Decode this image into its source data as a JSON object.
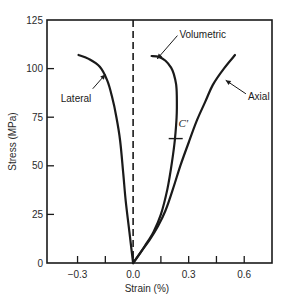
{
  "chart_data": {
    "type": "line",
    "title": "",
    "xlabel": "Strain (%)",
    "ylabel": "Stress (MPa)",
    "xlim": [
      -0.465,
      0.75
    ],
    "ylim": [
      0,
      125
    ],
    "x_ticks": [
      -0.3,
      -0.15,
      0.0,
      0.15,
      0.3,
      0.45,
      0.6
    ],
    "x_tick_labels": [
      "-0.3",
      "",
      "0.0",
      "",
      "0.3",
      "",
      "0.6"
    ],
    "y_ticks": [
      0,
      25,
      50,
      75,
      100,
      125
    ],
    "y_tick_labels": [
      "0",
      "25",
      "50",
      "75",
      "100",
      "125"
    ],
    "grid": false,
    "legend": null,
    "reference_line": {
      "x": 0.0,
      "style": "dashed"
    },
    "series": [
      {
        "name": "Lateral",
        "x": [
          -0.295,
          -0.24,
          -0.18,
          -0.14,
          -0.115,
          -0.09,
          -0.07,
          -0.055,
          -0.04,
          -0.02,
          0.0
        ],
        "y": [
          107,
          105,
          101,
          94,
          86,
          75,
          63,
          48,
          32,
          16,
          0
        ]
      },
      {
        "name": "Volumetric",
        "x": [
          0.1,
          0.14,
          0.175,
          0.205,
          0.22,
          0.232,
          0.236,
          0.235,
          0.225,
          0.21,
          0.185,
          0.15,
          0.11,
          0.065,
          0.03,
          0.0
        ],
        "y": [
          106.5,
          106,
          104,
          100.5,
          97,
          92,
          86,
          75,
          63,
          52,
          38,
          25,
          16,
          9,
          4,
          0
        ]
      },
      {
        "name": "Axial",
        "x": [
          0.0,
          0.045,
          0.09,
          0.135,
          0.175,
          0.215,
          0.255,
          0.3,
          0.345,
          0.39,
          0.43,
          0.49,
          0.55
        ],
        "y": [
          0,
          6,
          12,
          19,
          27,
          38,
          50,
          62,
          73.5,
          83,
          91.5,
          100,
          107
        ]
      }
    ],
    "annotations": [
      {
        "text": "Lateral",
        "x": -0.38,
        "y": 85,
        "arrow_to": [
          -0.15,
          97
        ]
      },
      {
        "text": "Volumetric",
        "x": 0.25,
        "y": 118,
        "arrow_to": [
          0.13,
          105
        ]
      },
      {
        "text": "Axial",
        "x": 0.62,
        "y": 86,
        "arrow_to": [
          0.5,
          94
        ]
      },
      {
        "text": "C'",
        "x": 0.245,
        "y": 70,
        "marker_at": [
          0.23,
          64
        ]
      }
    ]
  }
}
